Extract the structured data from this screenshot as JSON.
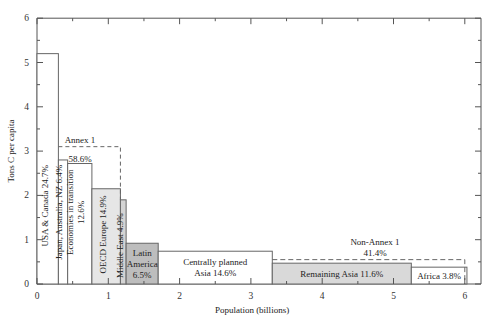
{
  "chart_data": {
    "type": "bar",
    "subtype": "variable-width step chart",
    "title": "",
    "xlabel": "Population (billions)",
    "ylabel": "Tons C per capita",
    "xlim": [
      0,
      6.3
    ],
    "ylim": [
      0,
      6
    ],
    "x_ticks": [
      "0",
      "1",
      "2",
      "3",
      "4",
      "5",
      "6"
    ],
    "y_ticks": [
      "0",
      "1",
      "2",
      "3",
      "4",
      "5",
      "6"
    ],
    "grid": false,
    "legend": null,
    "segments": [
      {
        "name": "USA & Canada",
        "share": "24.7%",
        "label": "USA & Canada 24.7%",
        "x_start": 0.0,
        "x_end": 0.3,
        "value": 5.2,
        "fill": "#ffffff",
        "vertical": true
      },
      {
        "name": "Japan, Australia, NZ",
        "share": "6.4%",
        "label": "Japan, Australia, NZ 6.4%",
        "x_start": 0.3,
        "x_end": 0.43,
        "value": 2.8,
        "fill": "#ffffff",
        "vertical": true
      },
      {
        "name": "Economies in transition",
        "share": "12.6%",
        "label": "Economies in transition 12.6%",
        "x_start": 0.43,
        "x_end": 0.77,
        "value": 2.72,
        "fill": "#ffffff",
        "vertical": true
      },
      {
        "name": "OECD Europe",
        "share": "14.9%",
        "label": "OECD Europe 14.9%",
        "x_start": 0.77,
        "x_end": 1.17,
        "value": 2.15,
        "fill": "#e6e6e6",
        "vertical": true
      },
      {
        "name": "Middle East",
        "share": "4.9%",
        "label": "Middle East 4.9%",
        "x_start": 1.17,
        "x_end": 1.25,
        "value": 1.9,
        "fill": "#d4d4d4",
        "vertical": true
      },
      {
        "name": "Latin America",
        "share": "6.5%",
        "label_lines": [
          "Latin",
          "America",
          "6.5%"
        ],
        "x_start": 1.25,
        "x_end": 1.7,
        "value": 0.92,
        "fill": "#bdbdbd",
        "vertical": false
      },
      {
        "name": "Centrally planned Asia",
        "share": "14.6%",
        "label_lines": [
          "Centrally planned",
          "Asia 14.6%"
        ],
        "x_start": 1.7,
        "x_end": 3.3,
        "value": 0.74,
        "fill": "#ffffff",
        "vertical": false
      },
      {
        "name": "Remaining Asia",
        "share": "11.6%",
        "label_lines": [
          "Remaining Asia 11.6%"
        ],
        "x_start": 3.3,
        "x_end": 5.25,
        "value": 0.47,
        "fill": "#d9d9d9",
        "vertical": false
      },
      {
        "name": "Africa",
        "share": "3.8%",
        "label_lines": [
          "Africa 3.8%"
        ],
        "x_start": 5.25,
        "x_end": 6.03,
        "value": 0.38,
        "fill": "#ffffff",
        "vertical": false
      }
    ],
    "annotations": [
      {
        "label": "Annex 1",
        "share": "58.6%",
        "x_start": 0.3,
        "x_end": 1.17,
        "dashed_level": 3.1
      },
      {
        "label": "Non-Annex 1",
        "share": "41.4%",
        "x_start": 1.7,
        "x_end": 6.0,
        "dashed_level": 0.55
      }
    ]
  },
  "labels": {
    "xlabel": "Population (billions)",
    "ylabel": "Tons C per capita",
    "annex1_title": "Annex 1",
    "annex1_share": "58.6%",
    "nonannex_title": "Non-Annex 1",
    "nonannex_share": "41.4%"
  }
}
